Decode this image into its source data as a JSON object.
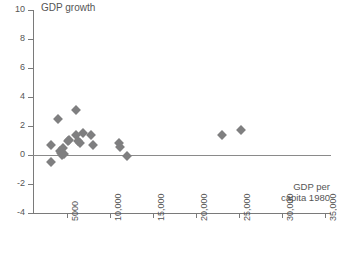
{
  "chart_data": {
    "type": "scatter",
    "title": "",
    "ylabel": "GDP growth",
    "xlabel": "GDP per\ncapita 1980",
    "xlabel_line1": "GDP per",
    "xlabel_line2": "capita 1980",
    "xlim": [
      2000,
      36500
    ],
    "ylim": [
      -4,
      10
    ],
    "grid": false,
    "legend": "none",
    "marker_color": "#7f7f80",
    "marker_shape": "diamond",
    "axis_color": "#7a7a7a",
    "y_ticks": [
      {
        "value": 10,
        "label": "10"
      },
      {
        "value": 8,
        "label": "8"
      },
      {
        "value": 6,
        "label": "6"
      },
      {
        "value": 4,
        "label": "4"
      },
      {
        "value": 2,
        "label": "2"
      },
      {
        "value": 0,
        "label": "0"
      },
      {
        "value": -2,
        "label": "-2"
      },
      {
        "value": -4,
        "label": "-4"
      }
    ],
    "x_ticks": [
      {
        "value": 5000,
        "label": "5000"
      },
      {
        "value": 10000,
        "label": "10,000"
      },
      {
        "value": 15000,
        "label": "15,000"
      },
      {
        "value": 20000,
        "label": "20,000"
      },
      {
        "value": 25000,
        "label": "25,000"
      },
      {
        "value": 30000,
        "label": "30,000"
      },
      {
        "value": 35000,
        "label": "35,000"
      }
    ],
    "points": [
      {
        "x": 3100,
        "y": -0.5
      },
      {
        "x": 3100,
        "y": 0.7
      },
      {
        "x": 4000,
        "y": 2.5
      },
      {
        "x": 4200,
        "y": 0.3
      },
      {
        "x": 4300,
        "y": 0.15
      },
      {
        "x": 4400,
        "y": 0.0
      },
      {
        "x": 4500,
        "y": 0.45
      },
      {
        "x": 4700,
        "y": 0.1
      },
      {
        "x": 5100,
        "y": 0.95
      },
      {
        "x": 5200,
        "y": 1.05
      },
      {
        "x": 6000,
        "y": 3.1
      },
      {
        "x": 6100,
        "y": 1.4
      },
      {
        "x": 6300,
        "y": 0.95
      },
      {
        "x": 6500,
        "y": 0.85
      },
      {
        "x": 6900,
        "y": 1.5
      },
      {
        "x": 7800,
        "y": 1.4
      },
      {
        "x": 8000,
        "y": 0.7
      },
      {
        "x": 11000,
        "y": 0.8
      },
      {
        "x": 11200,
        "y": 0.55
      },
      {
        "x": 12000,
        "y": -0.1
      },
      {
        "x": 23000,
        "y": 1.4
      },
      {
        "x": 25200,
        "y": 1.7
      }
    ]
  }
}
